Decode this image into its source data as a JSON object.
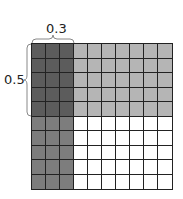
{
  "labels": {
    "top": "0.3",
    "left": "0.5"
  },
  "grid": {
    "rows": 10,
    "columns": 10,
    "shaded_columns": 3,
    "shaded_rows": 5
  },
  "colors": {
    "overlap": "#5c5c5c",
    "columns_only": "#7d7d7d",
    "rows_only": "#b5b5b5",
    "unshaded": "#ffffff",
    "lines": "#222222"
  }
}
